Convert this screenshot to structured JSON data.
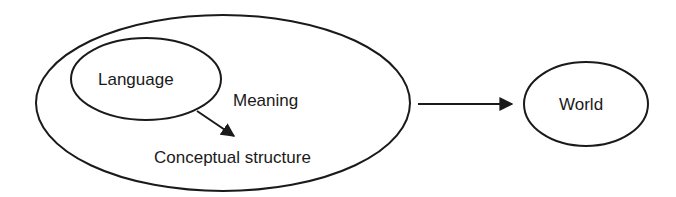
{
  "diagram": {
    "nodes": [
      {
        "id": "meaning",
        "label": "Meaning"
      },
      {
        "id": "language",
        "label": "Language"
      },
      {
        "id": "conceptual",
        "label": "Conceptual structure"
      },
      {
        "id": "world",
        "label": "World"
      }
    ],
    "edges": [
      {
        "from": "language",
        "to": "conceptual"
      },
      {
        "from": "meaning",
        "to": "world"
      }
    ],
    "colors": {
      "stroke": "#1a1a1a",
      "background": "#ffffff"
    }
  }
}
